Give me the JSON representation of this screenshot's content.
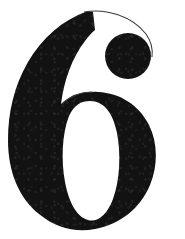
{
  "image": {
    "kind": "glyph-specimen",
    "character": "6",
    "character_name": "digit-six",
    "description": "Large black serif numeral 6 centered on a plain white background",
    "width": 185,
    "height": 239,
    "background_color": "#ffffff",
    "ink_color": "#121212",
    "hairline_color": "#3a3a3a"
  },
  "glyph": {
    "label": "6",
    "style": "serif-didone",
    "parts": [
      {
        "name": "stem-and-bowl",
        "label": "stem and bowl"
      },
      {
        "name": "ball-terminal",
        "label": "ball terminal"
      },
      {
        "name": "counter",
        "label": "counter"
      },
      {
        "name": "hairline-arc",
        "label": "hairline arc"
      }
    ],
    "geometry": {
      "bounds": {
        "x": 8,
        "y": 10,
        "width": 148,
        "height": 219
      },
      "ball_terminal": {
        "cx": 128,
        "cy": 56,
        "r": 23
      },
      "counter": {
        "cx": 90,
        "cy": 158,
        "rx": 26,
        "ry": 58
      },
      "stem_apex": {
        "x": 88,
        "y": 11
      },
      "baseline_y": 228
    }
  }
}
